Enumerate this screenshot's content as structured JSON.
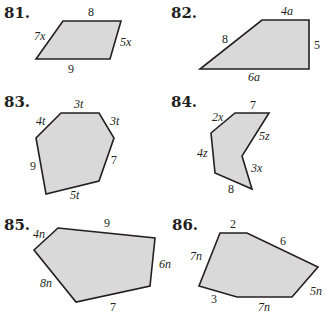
{
  "problems": [
    {
      "number": "81.",
      "shape": "parallelogram-like quadrilateral",
      "sides": [
        "8",
        "5x",
        "9",
        "7x"
      ]
    },
    {
      "number": "82.",
      "shape": "right trapezoid",
      "sides": [
        "4a",
        "5",
        "6a",
        "8"
      ]
    },
    {
      "number": "83.",
      "shape": "hexagon",
      "sides": [
        "3t",
        "3t",
        "7",
        "5t",
        "9",
        "4t"
      ]
    },
    {
      "number": "84.",
      "shape": "concave hexagon",
      "sides": [
        "7",
        "5z",
        "3x",
        "8",
        "4z",
        "2x"
      ]
    },
    {
      "number": "85.",
      "shape": "pentagon",
      "sides": [
        "9",
        "6n",
        "7",
        "8n",
        "4n"
      ]
    },
    {
      "number": "86.",
      "shape": "hexagon",
      "sides": [
        "2",
        "6",
        "5n",
        "7n",
        "3",
        "7n"
      ]
    }
  ],
  "style": {
    "fill_color": "#d9d9d9",
    "stroke_color": "#231f20"
  }
}
